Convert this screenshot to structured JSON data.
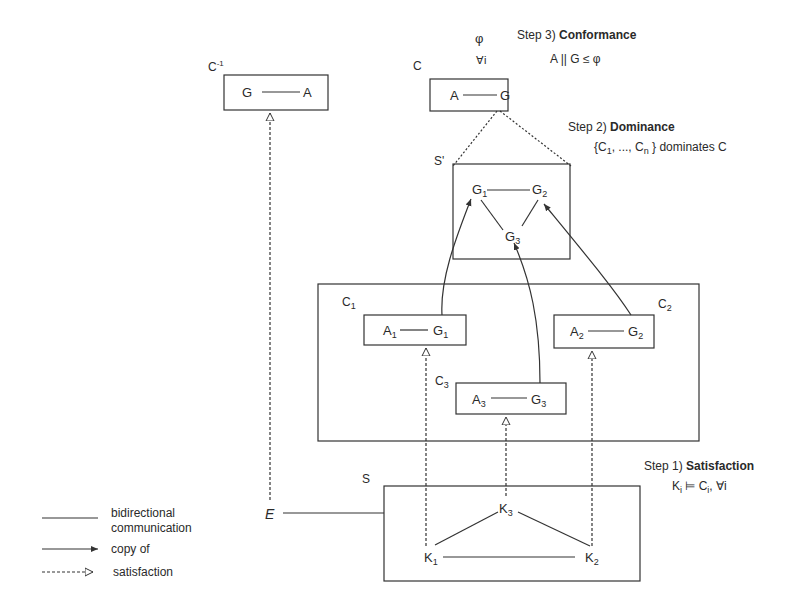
{
  "steps": {
    "step3": {
      "prefix": "Step 3) ",
      "title": "Conformance",
      "formula": "A || G ≤ φ",
      "phi": "φ",
      "forall_i": "∀i"
    },
    "step2": {
      "prefix": "Step 2) ",
      "title": "Dominance",
      "formula_open": "{C",
      "sub1": "1",
      "formula_mid": ", ..., C",
      "subn": "n",
      "formula_close": " } dominates C"
    },
    "step1": {
      "prefix": "Step 1) ",
      "title": "Satisfaction",
      "K": "K",
      "sub_i": "i",
      "models": " ⊨ C",
      "sub_i2": "i",
      "forall": ",  ∀i"
    }
  },
  "boxes": {
    "c_inverse": {
      "label": "C",
      "sup": "-1",
      "left": "G",
      "right": "A"
    },
    "c": {
      "label": "C",
      "left": "A",
      "right": "G"
    },
    "s_prime": {
      "label": "S'",
      "g1": "G",
      "g1_sub": "1",
      "g2": "G",
      "g2_sub": "2",
      "g3": "G",
      "g3_sub": "3"
    },
    "c1": {
      "label": "C",
      "label_sub": "1",
      "left": "A",
      "left_sub": "1",
      "right": "G",
      "right_sub": "1"
    },
    "c2": {
      "label": "C",
      "label_sub": "2",
      "left": "A",
      "left_sub": "2",
      "right": "G",
      "right_sub": "2"
    },
    "c3": {
      "label": "C",
      "label_sub": "3",
      "left": "A",
      "left_sub": "3",
      "right": "G",
      "right_sub": "3"
    },
    "s": {
      "label": "S",
      "k1": "K",
      "k1_sub": "1",
      "k2": "K",
      "k2_sub": "2",
      "k3": "K",
      "k3_sub": "3"
    }
  },
  "environment": {
    "label": "E"
  },
  "legend": {
    "items": [
      {
        "line": "solid",
        "label_line1": "bidirectional",
        "label_line2": "communication"
      },
      {
        "line": "arrow",
        "label_line1": "copy of"
      },
      {
        "line": "dashed-open-arrow",
        "label_line1": "satisfaction"
      }
    ]
  },
  "colors": {
    "stroke": "#333333",
    "text": "#2a2a2a",
    "background": "#ffffff"
  }
}
